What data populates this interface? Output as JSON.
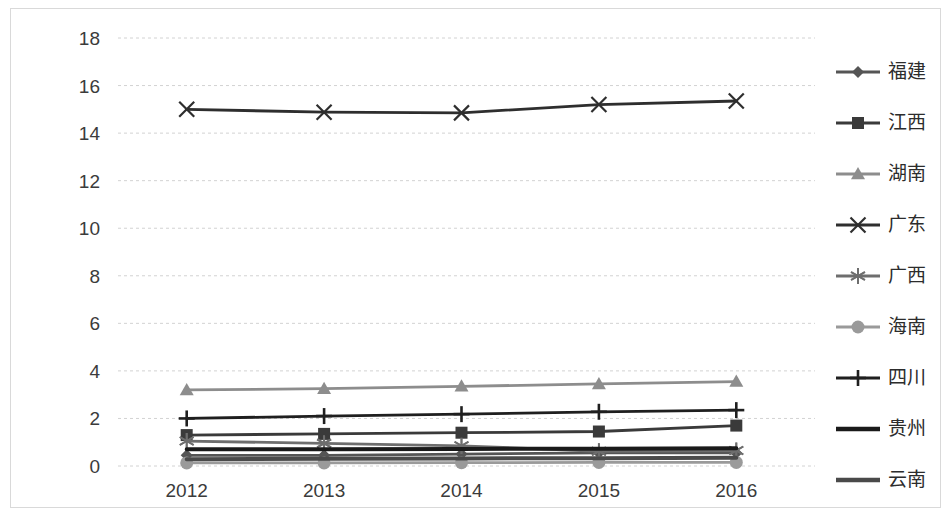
{
  "chart_data": {
    "type": "line",
    "title": "",
    "xlabel": "",
    "ylabel": "",
    "categories": [
      "2012",
      "2013",
      "2014",
      "2015",
      "2016"
    ],
    "ylim": [
      0,
      18
    ],
    "ytick_labels": [
      "0",
      "2",
      "4",
      "6",
      "8",
      "10",
      "12",
      "14",
      "16",
      "18"
    ],
    "yticks": [
      0,
      2,
      4,
      6,
      8,
      10,
      12,
      14,
      16,
      18
    ],
    "grid": true,
    "legend_position": "right",
    "series": [
      {
        "name": "福建",
        "marker": "diamond",
        "color": "#555555",
        "values": [
          0.45,
          0.45,
          0.5,
          0.55,
          0.55
        ]
      },
      {
        "name": "江西",
        "marker": "square",
        "color": "#3a3a3a",
        "values": [
          1.3,
          1.35,
          1.4,
          1.45,
          1.7
        ]
      },
      {
        "name": "湖南",
        "marker": "triangle",
        "color": "#8d8d8d",
        "values": [
          3.2,
          3.25,
          3.35,
          3.45,
          3.55
        ]
      },
      {
        "name": "广东",
        "marker": "x",
        "color": "#2e2e2e",
        "values": [
          15.0,
          14.88,
          14.85,
          15.2,
          15.35
        ]
      },
      {
        "name": "广西",
        "marker": "asterisk",
        "color": "#6e6e6e",
        "values": [
          1.05,
          0.95,
          0.85,
          0.62,
          0.65
        ]
      },
      {
        "name": "海南",
        "marker": "circle",
        "color": "#9a9a9a",
        "values": [
          0.13,
          0.13,
          0.14,
          0.15,
          0.15
        ]
      },
      {
        "name": "四川",
        "marker": "plus",
        "color": "#1f1f1f",
        "values": [
          2.0,
          2.1,
          2.18,
          2.28,
          2.35
        ]
      },
      {
        "name": "贵州",
        "marker": "none",
        "color": "#1a1a1a",
        "values": [
          0.7,
          0.7,
          0.72,
          0.73,
          0.75
        ]
      },
      {
        "name": "云南",
        "marker": "none",
        "color": "#4a4a4a",
        "values": [
          0.28,
          0.3,
          0.32,
          0.33,
          0.35
        ]
      }
    ]
  },
  "colors": {
    "background": "#ffffff",
    "border": "#d9d9d9",
    "gridline": "#d2d2d2",
    "tick_text": "#3b3b3b",
    "legend_text": "#2c2c2c"
  }
}
